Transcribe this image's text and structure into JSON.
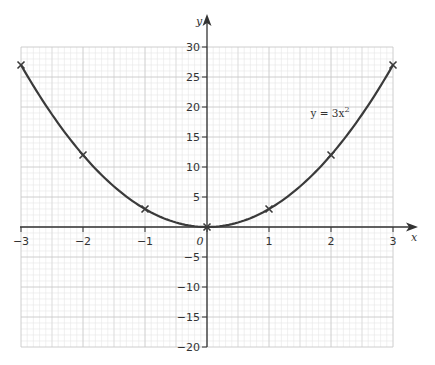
{
  "chart_data": {
    "type": "line",
    "title": "",
    "xlabel": "x",
    "ylabel": "y",
    "xlim": [
      -3,
      3
    ],
    "ylim": [
      -20,
      30
    ],
    "grid": true,
    "x_ticks": [
      -3,
      -2,
      -1,
      0,
      1,
      2,
      3
    ],
    "x_tick_labels": [
      "−3",
      "−2",
      "−1",
      "",
      "1",
      "2",
      "3"
    ],
    "y_ticks": [
      30,
      25,
      20,
      15,
      10,
      5,
      -5,
      -10,
      -15,
      -20
    ],
    "y_tick_labels": [
      "30",
      "25",
      "20",
      "15",
      "10",
      "5",
      "−5",
      "−10",
      "−15",
      "−20"
    ],
    "origin_label": "0",
    "series": [
      {
        "name": "y = 3x²",
        "function": "3x^2",
        "color": "#3a3a3a",
        "x": [
          -3,
          -2,
          -1,
          0,
          1,
          2,
          3
        ],
        "values": [
          27,
          12,
          3,
          0,
          3,
          12,
          27
        ],
        "marker": "x"
      }
    ],
    "annotations": [
      {
        "text_main": "y = 3x",
        "text_sup": "2",
        "x": 1.7,
        "y": 19
      }
    ]
  },
  "style": {
    "curve_color": "#3a3a3a",
    "axis_color": "#333333",
    "major_grid_color": "#c8c8c8",
    "minor_grid_color": "#e6e6e6"
  }
}
